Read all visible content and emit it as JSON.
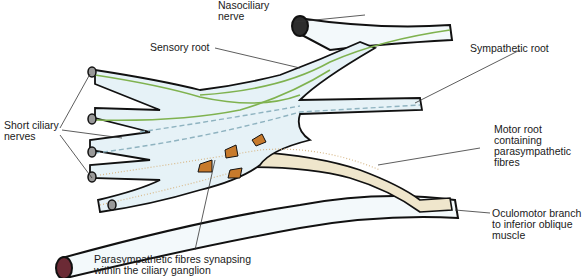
{
  "labels": {
    "nasociliary": "Nasociliary\nnerve",
    "sensory_root": "Sensory root",
    "sympathetic_root": "Sympathetic root",
    "short_ciliary": "Short ciliary\nnerves",
    "motor_root": "Motor root\ncontaining\nparasympathetic\nfibres",
    "oculomotor_branch": "Oculomotor branch\nto inferior oblique\nmuscle",
    "parasympathetic_synapse": "Parasympathetic fibres synapsing\nwithin the ciliary ganglion"
  },
  "colors": {
    "outline": "#111111",
    "ganglion_fill": "#e6f2f7",
    "sensory_fibre": "#7fb24f",
    "sympathetic_fibre": "#8fb3c0",
    "parasympathetic_fill": "#efe6cc",
    "parasympathetic_dots": "#d8b98a",
    "neuron_body": "#c77a2c",
    "arrow": "#b59a78",
    "nerve_cut_fill": "#6b2a35",
    "leader_line": "#333333"
  }
}
